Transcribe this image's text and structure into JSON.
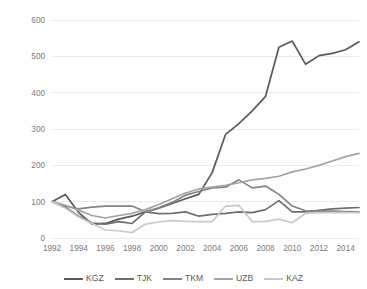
{
  "chart_data": {
    "type": "line",
    "title": "",
    "subtitle": "",
    "xlabel": "",
    "ylabel": "",
    "xlim": [
      1992,
      2015
    ],
    "ylim": [
      0,
      600
    ],
    "grid": true,
    "legend_position": "bottom",
    "y_ticks": [
      0,
      100,
      200,
      300,
      400,
      500,
      600
    ],
    "y_tick_labels": [
      "0",
      "100",
      "200",
      "300",
      "400",
      "500",
      "600"
    ],
    "x_tick_labels": [
      "1992",
      "1994",
      "1996",
      "1998",
      "2000",
      "2002",
      "2004",
      "2006",
      "2008",
      "2010",
      "2012",
      "2014"
    ],
    "x_ticks": [
      1992,
      1994,
      1996,
      1998,
      2000,
      2002,
      2004,
      2006,
      2008,
      2010,
      2012,
      2014
    ],
    "x": [
      1992,
      1993,
      1994,
      1995,
      1996,
      1997,
      1998,
      1999,
      2000,
      2001,
      2002,
      2003,
      2004,
      2005,
      2006,
      2007,
      2008,
      2009,
      2010,
      2011,
      2012,
      2013,
      2014,
      2015
    ],
    "series": [
      {
        "name": "KGZ",
        "color": "#595959",
        "values": [
          100,
          120,
          70,
          38,
          40,
          52,
          60,
          72,
          82,
          95,
          108,
          120,
          180,
          285,
          315,
          350,
          390,
          525,
          542,
          478,
          502,
          508,
          518,
          540
        ]
      },
      {
        "name": "TJK",
        "color": "#6e6e6e",
        "values": [
          100,
          85,
          60,
          41,
          38,
          45,
          40,
          72,
          67,
          68,
          72,
          60,
          65,
          68,
          72,
          70,
          78,
          103,
          72,
          72,
          76,
          80,
          82,
          84
        ]
      },
      {
        "name": "TKM",
        "color": "#838383",
        "values": [
          100,
          88,
          80,
          85,
          88,
          88,
          88,
          72,
          83,
          98,
          118,
          128,
          138,
          140,
          160,
          138,
          143,
          120,
          88,
          75,
          74,
          74,
          73,
          72
        ]
      },
      {
        "name": "UZB",
        "color": "#a3a3a3",
        "values": [
          100,
          90,
          76,
          62,
          55,
          62,
          68,
          78,
          92,
          108,
          124,
          135,
          140,
          145,
          152,
          160,
          164,
          170,
          182,
          190,
          200,
          212,
          224,
          233
        ]
      },
      {
        "name": "KAZ",
        "color": "#c9c9c9",
        "values": [
          100,
          82,
          58,
          40,
          22,
          20,
          15,
          38,
          44,
          48,
          46,
          45,
          45,
          88,
          90,
          45,
          46,
          52,
          42,
          68,
          70,
          70,
          70,
          70
        ]
      }
    ]
  },
  "legend": {
    "items": [
      {
        "label": "KGZ"
      },
      {
        "label": "TJK"
      },
      {
        "label": "TKM"
      },
      {
        "label": "UZB"
      },
      {
        "label": "KAZ"
      }
    ]
  }
}
